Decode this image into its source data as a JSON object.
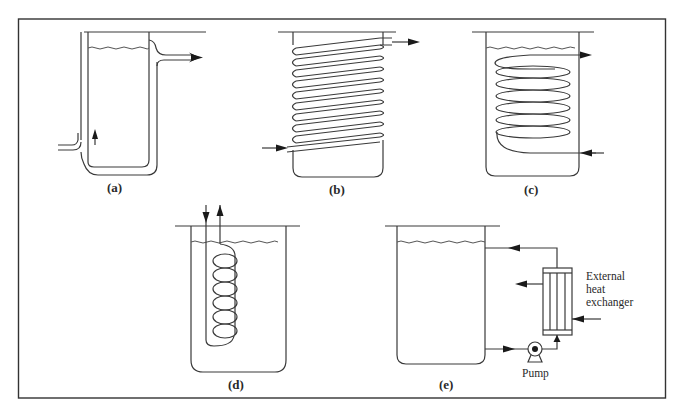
{
  "figure": {
    "panels": [
      {
        "id": "a",
        "label": "(a)",
        "description": "Jacketed vessel"
      },
      {
        "id": "b",
        "label": "(b)",
        "description": "External coil wrapped around vessel"
      },
      {
        "id": "c",
        "label": "(c)",
        "description": "Internal helical coil"
      },
      {
        "id": "d",
        "label": "(d)",
        "description": "Internal coil bundle (bayonet)"
      },
      {
        "id": "e",
        "label": "(e)",
        "description": "External heat exchanger loop with pump"
      }
    ],
    "annotations": {
      "external_hx_line1": "External",
      "external_hx_line2": "heat",
      "external_hx_line3": "exchanger",
      "pump": "Pump"
    }
  }
}
